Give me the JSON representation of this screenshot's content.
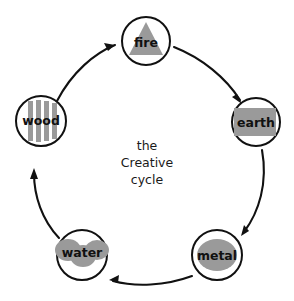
{
  "diagram": {
    "title": "the Creative cycle",
    "center_text_lines": [
      "the",
      "Creative",
      "cycle"
    ],
    "background_color": "#ffffff",
    "stroke_color": "#111111",
    "glyph_color": "#9a9a9a",
    "nodes": [
      {
        "id": "fire",
        "label": "fire",
        "glyph": "triangle-icon",
        "cx": 146,
        "cy": 41,
        "r": 24
      },
      {
        "id": "earth",
        "label": "earth",
        "glyph": "square-icon",
        "cx": 256,
        "cy": 122,
        "r": 24
      },
      {
        "id": "metal",
        "label": "metal",
        "glyph": "circle-icon",
        "cx": 217,
        "cy": 255,
        "r": 25
      },
      {
        "id": "water",
        "label": "water",
        "glyph": "wave-icon",
        "cx": 82,
        "cy": 255,
        "r": 25
      },
      {
        "id": "wood",
        "label": "wood",
        "glyph": "bars-icon",
        "cx": 41,
        "cy": 121,
        "r": 25
      }
    ],
    "arrows": [
      {
        "id": "wood-to-fire",
        "from": "wood",
        "to": "fire"
      },
      {
        "id": "fire-to-earth",
        "from": "fire",
        "to": "earth"
      },
      {
        "id": "earth-to-metal",
        "from": "earth",
        "to": "metal"
      },
      {
        "id": "metal-to-water",
        "from": "metal",
        "to": "water"
      },
      {
        "id": "water-to-wood",
        "from": "water",
        "to": "wood"
      }
    ]
  }
}
